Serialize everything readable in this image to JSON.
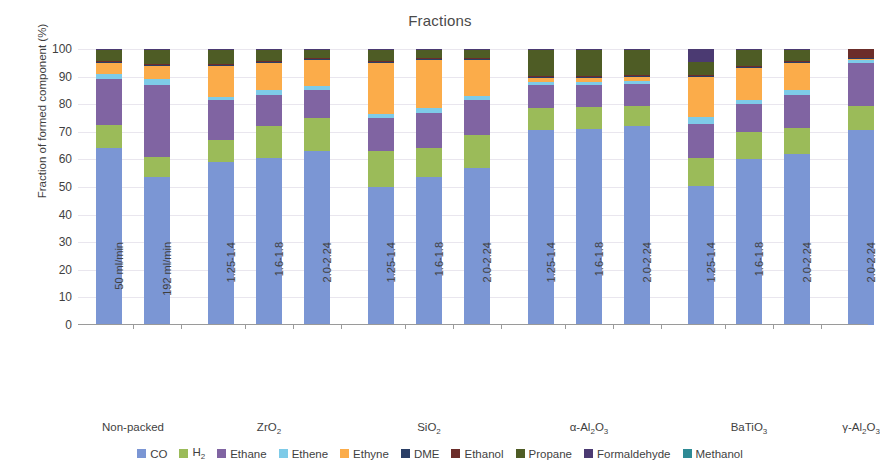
{
  "chart_data": {
    "type": "bar",
    "stacked": true,
    "title": "Fractions",
    "xlabel": "",
    "ylabel": "Fraction of formed component (%)",
    "ylim": [
      0,
      100
    ],
    "ytick_values": [
      0,
      10,
      20,
      30,
      40,
      50,
      60,
      70,
      80,
      90,
      100
    ],
    "grid": true,
    "legend_position": "bottom",
    "categories": [
      "50 ml/min",
      "192 ml/min",
      "1.25-1.4",
      "1.6-1.8",
      "2.0-2.24",
      "1.25-1.4",
      "1.6-1.8",
      "2.0-2.24",
      "1.25-1.4",
      "1.6-1.8",
      "2.0-2.24",
      "1.25-1.4",
      "1.6-1.8",
      "2.0-2.24",
      "2.0-2.24"
    ],
    "groups": [
      {
        "label": "Non-packed",
        "label_html": "Non-packed",
        "start": 0,
        "count": 2
      },
      {
        "label": "ZrO2",
        "label_html": "ZrO<sub>2</sub>",
        "start": 2,
        "count": 3
      },
      {
        "label": "SiO2",
        "label_html": "SiO<sub>2</sub>",
        "start": 5,
        "count": 3
      },
      {
        "label": "alpha-Al2O3",
        "label_html": "α-Al<sub>2</sub>O<sub>3</sub>",
        "start": 8,
        "count": 3
      },
      {
        "label": "BaTiO3",
        "label_html": "BaTiO<sub>3</sub>",
        "start": 11,
        "count": 3
      },
      {
        "label": "gamma-Al2O3",
        "label_html": "γ-Al<sub>2</sub>O<sub>3</sub>",
        "start": 14,
        "count": 1
      }
    ],
    "series": [
      {
        "name": "CO",
        "color": "#7b96d4",
        "values": [
          64.0,
          53.5,
          59.0,
          60.5,
          63.0,
          50.0,
          53.5,
          57.0,
          70.5,
          71.0,
          72.0,
          50.5,
          60.0,
          62.0,
          70.5
        ]
      },
      {
        "name": "H2",
        "color": "#9bbb59",
        "values": [
          8.5,
          7.5,
          8.0,
          11.5,
          12.0,
          13.0,
          10.5,
          12.0,
          8.0,
          8.0,
          7.5,
          10.0,
          10.0,
          9.5,
          9.0
        ]
      },
      {
        "name": "Ethane",
        "color": "#8064a2",
        "values": [
          16.5,
          26.0,
          14.5,
          11.5,
          10.0,
          12.0,
          13.0,
          12.5,
          8.5,
          8.0,
          8.0,
          12.5,
          10.0,
          12.0,
          15.5
        ]
      },
      {
        "name": "Ethene",
        "color": "#7ecbe8",
        "values": [
          2.0,
          2.0,
          1.0,
          1.5,
          1.5,
          1.5,
          1.5,
          1.5,
          1.0,
          1.0,
          1.0,
          2.5,
          1.5,
          1.5,
          1.0
        ]
      },
      {
        "name": "Ethyne",
        "color": "#fbac4a",
        "values": [
          4.0,
          5.0,
          11.5,
          10.0,
          9.5,
          18.5,
          17.5,
          13.0,
          1.5,
          1.5,
          1.5,
          14.5,
          11.5,
          10.0,
          0.5
        ]
      },
      {
        "name": "DME",
        "color": "#2a3e66",
        "values": [
          0.4,
          0.4,
          0.4,
          0.4,
          0.4,
          0.4,
          0.4,
          0.4,
          0.4,
          0.4,
          0.4,
          0.4,
          0.4,
          0.4,
          0.4
        ]
      },
      {
        "name": "Ethanol",
        "color": "#6b2d2a",
        "values": [
          0.3,
          0.3,
          0.3,
          0.3,
          0.3,
          0.3,
          0.3,
          0.3,
          0.3,
          0.3,
          0.3,
          0.3,
          0.3,
          0.3,
          3.0
        ]
      },
      {
        "name": "Propane",
        "color": "#4e5c25",
        "values": [
          4.0,
          5.0,
          5.0,
          4.0,
          3.0,
          4.0,
          3.0,
          3.0,
          9.5,
          9.5,
          9.0,
          4.5,
          6.0,
          4.0,
          0.0
        ]
      },
      {
        "name": "Formaldehyde",
        "color": "#4b3a72",
        "values": [
          0.3,
          0.3,
          0.3,
          0.3,
          0.3,
          0.3,
          0.3,
          0.3,
          0.3,
          0.3,
          0.3,
          4.8,
          0.3,
          0.3,
          0.1
        ]
      },
      {
        "name": "Methanol",
        "color": "#2e8a95",
        "values": [
          0.0,
          0.0,
          0.0,
          0.0,
          0.0,
          0.0,
          0.0,
          0.0,
          0.0,
          0.0,
          0.0,
          0.0,
          0.0,
          0.0,
          0.0
        ]
      }
    ]
  },
  "legend": {
    "items": [
      {
        "label": "CO",
        "label_html": "CO",
        "color": "#7b96d4"
      },
      {
        "label": "H2",
        "label_html": "H<sub>2</sub>",
        "color": "#9bbb59"
      },
      {
        "label": "Ethane",
        "label_html": "Ethane",
        "color": "#8064a2"
      },
      {
        "label": "Ethene",
        "label_html": "Ethene",
        "color": "#7ecbe8"
      },
      {
        "label": "Ethyne",
        "label_html": "Ethyne",
        "color": "#fbac4a"
      },
      {
        "label": "DME",
        "label_html": "DME",
        "color": "#2a3e66"
      },
      {
        "label": "Ethanol",
        "label_html": "Ethanol",
        "color": "#6b2d2a"
      },
      {
        "label": "Propane",
        "label_html": "Propane",
        "color": "#4e5c25"
      },
      {
        "label": "Formaldehyde",
        "label_html": "Formaldehyde",
        "color": "#4b3a72"
      },
      {
        "label": "Methanol",
        "label_html": "Methanol",
        "color": "#2e8a95"
      }
    ]
  }
}
